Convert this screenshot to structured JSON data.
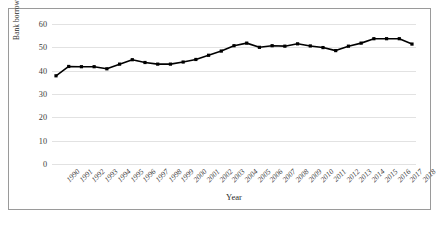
{
  "chart_data": {
    "type": "line",
    "title": "",
    "xlabel": "Year",
    "ylabel": "Bank borrowing to total borrowings\n(per cent)",
    "ylim": [
      0,
      60
    ],
    "yticks": [
      0,
      10,
      20,
      30,
      40,
      50,
      60
    ],
    "grid": true,
    "legend": null,
    "marker": "square",
    "line_color": "#000000",
    "marker_color": "#000000",
    "categories": [
      "1990",
      "1991",
      "1992",
      "1993",
      "1994",
      "1995",
      "1996",
      "1997",
      "1998",
      "1999",
      "2000",
      "2001",
      "2002",
      "2003",
      "2004",
      "2005",
      "2006",
      "2007",
      "2008",
      "2009",
      "2010",
      "2011",
      "2012",
      "2013",
      "2014",
      "2015",
      "2016",
      "2017",
      "2018"
    ],
    "values": [
      37.8,
      41.8,
      41.7,
      41.7,
      40.8,
      42.8,
      44.7,
      43.5,
      42.8,
      42.8,
      43.7,
      44.8,
      46.6,
      48.4,
      50.7,
      51.8,
      50.0,
      50.7,
      50.5,
      51.5,
      50.6,
      49.9,
      48.6,
      50.5,
      51.8,
      53.7,
      53.7,
      53.7,
      51.4
    ]
  },
  "axis": {
    "y_tick_labels": [
      "0",
      "10",
      "20",
      "30",
      "40",
      "50",
      "60"
    ],
    "x_tick_labels": [
      "1990",
      "1991",
      "1992",
      "1993",
      "1994",
      "1995",
      "1996",
      "1997",
      "1998",
      "1999",
      "2000",
      "2001",
      "2002",
      "2003",
      "2004",
      "2005",
      "2006",
      "2007",
      "2008",
      "2009",
      "2010",
      "2011",
      "2012",
      "2013",
      "2014",
      "2015",
      "2016",
      "2017",
      "2018"
    ],
    "x_title": "Year",
    "y_title": "Bank borrowing to total borrowings\n(per cent)"
  },
  "colors": {
    "frame": "#9a9a9a",
    "grid": "#e2e2e2",
    "series": "#000000",
    "text": "#2b2b2b",
    "background": "#ffffff"
  }
}
